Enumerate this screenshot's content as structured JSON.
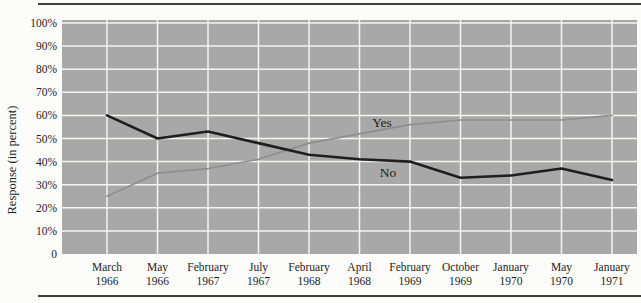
{
  "figure": {
    "y_axis_title": "Response (in percent)"
  },
  "chart_data": {
    "type": "line",
    "title": "",
    "xlabel": "",
    "ylabel": "Response (in percent)",
    "categories": [
      "March 1966",
      "May 1966",
      "February 1967",
      "July 1967",
      "February 1968",
      "April 1968",
      "February 1969",
      "October 1969",
      "January 1970",
      "May 1970",
      "January 1971"
    ],
    "series": [
      {
        "name": "Yes",
        "values": [
          25,
          35,
          37,
          41,
          48,
          52,
          56,
          58,
          58,
          58,
          60
        ],
        "color": "#8e8e8e",
        "width": 1.7
      },
      {
        "name": "No",
        "values": [
          60,
          50,
          53,
          48,
          43,
          41,
          40,
          33,
          34,
          37,
          32
        ],
        "color": "#1f1f1f",
        "width": 2.6
      }
    ],
    "ylim": [
      0,
      100
    ],
    "y_tick_labels": [
      "100%",
      "90%",
      "80%",
      "70%",
      "60%",
      "50%",
      "40%",
      "30%",
      "20%",
      "10%",
      "0"
    ],
    "grid": true,
    "legend_position": "inline-labels",
    "inline_labels": [
      {
        "series": "Yes",
        "x": 382,
        "y": 127
      },
      {
        "series": "No",
        "x": 388,
        "y": 177
      }
    ],
    "plot_bg": "#a8a8a8",
    "grid_color": "#f5f5f3"
  }
}
